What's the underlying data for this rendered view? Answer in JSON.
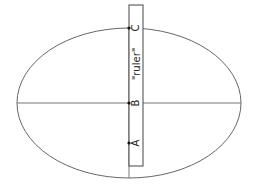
{
  "diagram": {
    "ruler_label": "\"ruler\"",
    "points": [
      {
        "id": "C",
        "label": "C"
      },
      {
        "id": "B",
        "label": "B"
      },
      {
        "id": "A",
        "label": "A"
      }
    ],
    "colors": {
      "stroke": "#555555",
      "point": "#111111"
    }
  }
}
